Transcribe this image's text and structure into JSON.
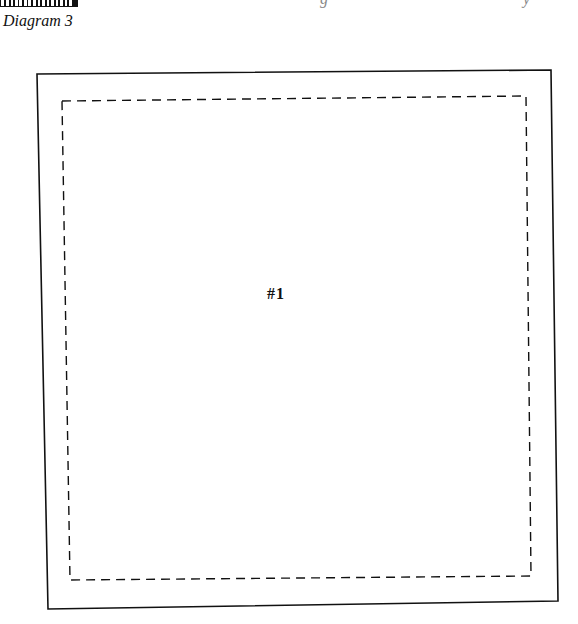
{
  "caption": "Diagram 3",
  "header_fragments": [
    "g",
    "y"
  ],
  "diagram": {
    "type": "square template with seam allowance",
    "piece_label": "#1",
    "outer_outline": {
      "style": "solid",
      "corners": [
        [
          37,
          74
        ],
        [
          551,
          70
        ],
        [
          558,
          601
        ],
        [
          48,
          609
        ]
      ]
    },
    "inner_outline": {
      "style": "dashed",
      "corners": [
        [
          62,
          101
        ],
        [
          526,
          96
        ],
        [
          531,
          576
        ],
        [
          70,
          580
        ]
      ]
    },
    "colors": {
      "line": "#111111",
      "background": "#ffffff"
    }
  }
}
